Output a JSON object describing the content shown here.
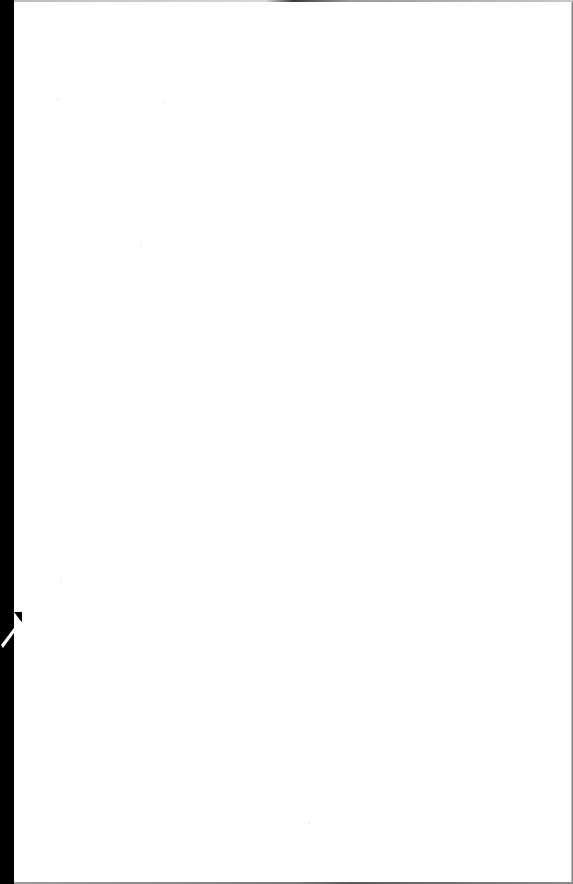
{
  "document": {
    "type": "scanned-page",
    "content": "",
    "colors": {
      "page": "#ffffff",
      "scan_border": "#000000"
    }
  }
}
